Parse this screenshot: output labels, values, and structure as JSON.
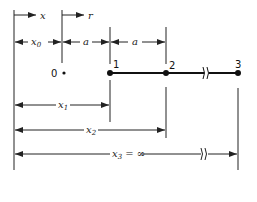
{
  "diagram": {
    "axes": {
      "x_label": "x",
      "r_label": "r"
    },
    "dimensions": {
      "x0": {
        "base": "x",
        "sub": "0"
      },
      "a1": "a",
      "a2": "a",
      "x1": {
        "base": "x",
        "sub": "1"
      },
      "x2": {
        "base": "x",
        "sub": "2"
      },
      "x3": {
        "base": "x",
        "sub": "3",
        "suffix": " = ∞"
      }
    },
    "nodes": [
      {
        "label": "0",
        "style": "small-dot"
      },
      {
        "label": "1",
        "style": "filled-dot"
      },
      {
        "label": "2",
        "style": "filled-dot"
      },
      {
        "label": "3",
        "style": "filled-dot"
      }
    ],
    "break_symbol": "//"
  }
}
